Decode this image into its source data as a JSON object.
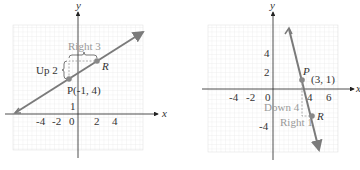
{
  "colors": {
    "line": "#7a7a7a",
    "grid": "#d6d6d6",
    "axis": "#222222",
    "point": "#888888",
    "annotation": "#999999"
  },
  "left_graph": {
    "x_axis_label": "x",
    "y_axis_label": "y",
    "x_ticks": [
      "-4",
      "-2",
      "0",
      "2",
      "4"
    ],
    "y_ticks": [
      "1"
    ],
    "point_p": "P(-1, 4)",
    "point_r": "R",
    "rise_label": "Up 2",
    "run_label": "Right 3"
  },
  "right_graph": {
    "x_axis_label": "x",
    "y_axis_label": "y",
    "x_ticks": [
      "-4",
      "-2",
      "0",
      "4",
      "6"
    ],
    "y_ticks": [
      "4",
      "2",
      "-4"
    ],
    "point_p_name": "P",
    "point_p_coords": "(3, 1)",
    "point_r": "R",
    "rise_label": "Down 4",
    "run_label": "Right 1"
  }
}
